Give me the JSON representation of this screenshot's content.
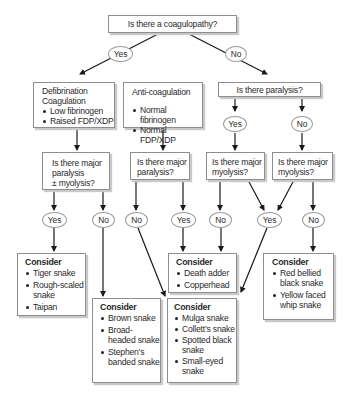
{
  "root": {
    "question": "Is there a coagulopathy?",
    "yes": "Yes",
    "no": "No"
  },
  "defibrination": {
    "title_line1": "Defibrination",
    "title_line2": "Coagulation",
    "items": [
      "Low fibrinogen",
      "Raised FDP/XDP"
    ]
  },
  "anticoag": {
    "title": "Anti-coagulation",
    "items": [
      "Normal fibrinogen",
      "Normal FDP/XDP"
    ]
  },
  "paralysis": {
    "question": "Is there paralysis?",
    "yes": "Yes",
    "no": "No"
  },
  "q_major_paralysis_myolysis": {
    "line1": "Is there major",
    "line2": "paralysis",
    "line3": "± myolysis?",
    "yes": "Yes",
    "no": "No"
  },
  "q_major_paralysis": {
    "line1": "Is there major",
    "line2": "paralysis?",
    "no": "No",
    "yes": "Yes"
  },
  "q_myolysis_a": {
    "line1": "Is there major",
    "line2": "myolysis?",
    "no": "No"
  },
  "q_myolysis_b": {
    "line1": "Is there major",
    "line2": "myolysis?",
    "no": "No"
  },
  "shared_yes": "Yes",
  "consider": [
    {
      "title": "Consider",
      "items": [
        "Tiger snake",
        "Rough-scaled snake",
        "Taipan"
      ]
    },
    {
      "title": "Consider",
      "items": [
        "Brown snake",
        "Broad-headed snake",
        "Stephen’s banded snake"
      ]
    },
    {
      "title": "Consider",
      "items": [
        "Death adder",
        "Copperhead"
      ]
    },
    {
      "title": "Consider",
      "items": [
        "Mulga snake",
        "Collett’s snake",
        "Spotted black snake",
        "Small-eyed snake"
      ]
    },
    {
      "title": "Consider",
      "items": [
        "Red bellied black snake",
        "Yellow faced whip snake"
      ]
    }
  ]
}
